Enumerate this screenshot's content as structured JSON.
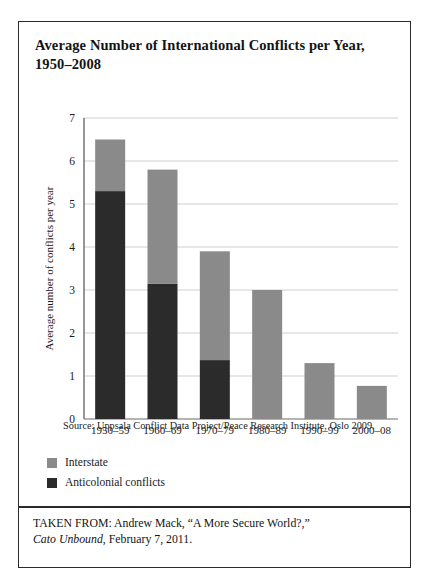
{
  "figure": {
    "title": "Average Number of International Conflicts per Year, 1950–2008",
    "source_note": "Source: Uppsala Conflict Data Project/Peace Research Institute, Oslo 2009.",
    "attribution_line1": "TAKEN FROM: Andrew Mack, “A More Secure World?,”",
    "attribution_source": "Cato Unbound",
    "attribution_line2": ", February 7, 2011."
  },
  "legend": {
    "items": [
      {
        "label": "Interstate",
        "color": "#8a8a8a"
      },
      {
        "label": "Anticolonial conflicts",
        "color": "#2b2b2b"
      }
    ]
  },
  "colors": {
    "interstate": "#8a8a8a",
    "anticolonial": "#2b2b2b",
    "gridline": "#c9c9c9",
    "axis": "#6b6b6b",
    "text": "#1a1a1a"
  },
  "chart_data": {
    "type": "bar",
    "subtype": "stacked-vertical",
    "title": "Average Number of International Conflicts per Year, 1950–2008",
    "xlabel": "",
    "ylabel": "Average number of conflicts per year",
    "categories": [
      "1950–59",
      "1960–69",
      "1970–79",
      "1980–89",
      "1990–99",
      "2000–08"
    ],
    "series": [
      {
        "name": "Anticolonial conflicts",
        "color": "#2b2b2b",
        "values": [
          5.3,
          3.15,
          1.37,
          0,
          0,
          0
        ]
      },
      {
        "name": "Interstate",
        "color": "#8a8a8a",
        "values": [
          1.2,
          2.65,
          2.53,
          3.0,
          1.3,
          0.77
        ]
      }
    ],
    "totals": [
      6.5,
      5.8,
      3.9,
      3.0,
      1.3,
      0.77
    ],
    "ylim": [
      0,
      7
    ],
    "yticks": [
      0,
      1,
      2,
      3,
      4,
      5,
      6,
      7
    ],
    "ytick_labels": [
      "0",
      "1",
      "2",
      "3",
      "4",
      "5",
      "6",
      "7"
    ],
    "grid": true,
    "legend_position": "below-plot-left"
  }
}
